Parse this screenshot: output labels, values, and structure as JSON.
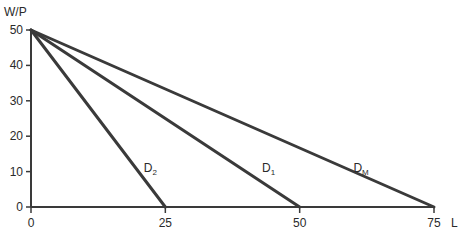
{
  "chart_data": {
    "type": "line",
    "title": "",
    "xlabel": "L",
    "ylabel": "W/P",
    "xlim": [
      0,
      75
    ],
    "ylim": [
      0,
      50
    ],
    "x_ticks": [
      0,
      25,
      50,
      75
    ],
    "y_ticks": [
      0,
      10,
      20,
      30,
      40,
      50
    ],
    "x_tick_labels": [
      "0",
      "25",
      "50",
      "75"
    ],
    "y_tick_labels": [
      "0",
      "10",
      "20",
      "30",
      "40",
      "50"
    ],
    "grid": false,
    "legend": "none",
    "series": [
      {
        "name": "D2",
        "label_main": "D",
        "label_sub": "2",
        "x": [
          0,
          25
        ],
        "y": [
          50,
          0
        ],
        "label_at": [
          21,
          10
        ]
      },
      {
        "name": "D1",
        "label_main": "D",
        "label_sub": "1",
        "x": [
          0,
          50
        ],
        "y": [
          50,
          0
        ],
        "label_at": [
          43,
          10
        ]
      },
      {
        "name": "DM",
        "label_main": "D",
        "label_sub": "M",
        "x": [
          0,
          75
        ],
        "y": [
          50,
          0
        ],
        "label_at": [
          60,
          10
        ]
      }
    ],
    "line_color": "#3a3a3a"
  }
}
